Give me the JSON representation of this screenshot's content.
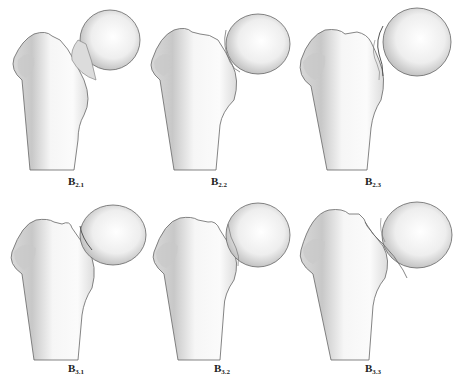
{
  "figure": {
    "panels": [
      {
        "id": "B2.1",
        "letter": "B",
        "subscript": "2.1",
        "row": 1,
        "col": 1
      },
      {
        "id": "B2.2",
        "letter": "B",
        "subscript": "2.2",
        "row": 1,
        "col": 2
      },
      {
        "id": "B2.3",
        "letter": "B",
        "subscript": "2.3",
        "row": 1,
        "col": 3
      },
      {
        "id": "B3.1",
        "letter": "B",
        "subscript": "3.1",
        "row": 2,
        "col": 1
      },
      {
        "id": "B3.2",
        "letter": "B",
        "subscript": "3.2",
        "row": 2,
        "col": 2
      },
      {
        "id": "B3.3",
        "letter": "B",
        "subscript": "3.3",
        "row": 2,
        "col": 3
      }
    ],
    "colors": {
      "background": "#ffffff",
      "outline": "#555555",
      "shade": "#bdbdbd",
      "bone": "#f4f4f4"
    }
  }
}
